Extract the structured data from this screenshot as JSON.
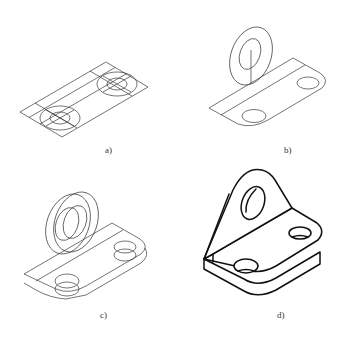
{
  "figure": {
    "panels": [
      {
        "id": "a",
        "label": "a)",
        "content": "Base plate parallelogram with two hole center ellipses and construction lines"
      },
      {
        "id": "b",
        "label": "b)",
        "content": "Base plate outline with rounded corners, hole ellipses, and upright lug circle outline"
      },
      {
        "id": "c",
        "label": "c)",
        "content": "Thickness added to base plate, holes and lug (double contours)"
      },
      {
        "id": "d",
        "label": "d)",
        "content": "Finished isometric bracket with lug, bore and two countersunk holes"
      }
    ]
  },
  "colors": {
    "line": "#2a2a2a",
    "bold_line": "#111111",
    "background": "#ffffff"
  }
}
